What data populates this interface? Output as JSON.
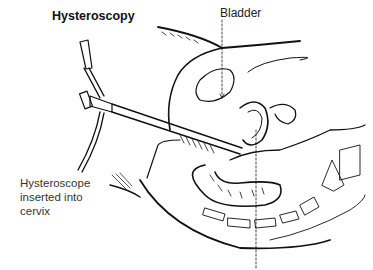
{
  "diagram": {
    "title": "Hysteroscopy",
    "labels": {
      "bladder": "Bladder",
      "hysteroscope": [
        "Hysteroscope",
        "inserted into",
        "cervix"
      ]
    },
    "colors": {
      "ink": "#111111",
      "background": "#ffffff"
    }
  }
}
